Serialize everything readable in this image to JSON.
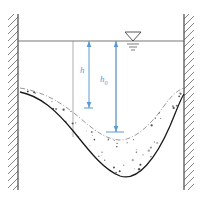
{
  "figure": {
    "width": 202,
    "height": 202,
    "background": "#ffffff"
  },
  "colors": {
    "wall_line": "#555555",
    "hatch": "#666666",
    "water_surface": "#666666",
    "dimension": "#5b9bd5",
    "original_bed": "#777777",
    "scoured_bed": "#1a1a1a",
    "sediment_stipple": "#3a3a3a",
    "water_symbol": "#444444"
  },
  "walls": {
    "left": {
      "name": "left-bank-wall",
      "x": 18,
      "y_top": 14,
      "y_bottom": 190,
      "hatch_side": "left"
    },
    "right": {
      "name": "right-bank-wall",
      "x": 184,
      "y_top": 14,
      "y_bottom": 190,
      "hatch_side": "right"
    }
  },
  "water_surface": {
    "label": "water-surface-line",
    "y": 41,
    "x_start": 18,
    "x_end": 184
  },
  "water_level_symbol": {
    "label": "water-level-triangle",
    "x": 133,
    "y": 41,
    "triangle_half_width": 8,
    "triangle_height": 9,
    "tick_widths": [
      11,
      7,
      4
    ]
  },
  "dimensions": [
    {
      "id": "h",
      "label": "h",
      "subscript": "",
      "x": 89,
      "y_top": 41,
      "y_bottom": 108,
      "value_text": "h",
      "label_x": 83,
      "label_y": 71,
      "arrow": "double-headed",
      "baseline_tick_width": 9
    },
    {
      "id": "h0",
      "label": "h",
      "subscript": "0",
      "x": 116,
      "y_top": 41,
      "y_bottom": 132,
      "value_text": "h0",
      "label_x": 103,
      "label_y": 80,
      "arrow": "double-headed",
      "baseline_tick_width": 18
    }
  ],
  "guide_lines": [
    {
      "name": "left-datum-guide",
      "x": 73,
      "y_top": 41,
      "y_bottom": 137
    },
    {
      "name": "right-datum-guide",
      "x": 116,
      "y_top": 41,
      "y_bottom": 132
    }
  ],
  "beds": {
    "original_bed": {
      "name": "original-bed-profile",
      "style": "dashed-light",
      "path": "M 20 88 C 45 92, 62 103, 80 118 C 96 132, 108 140, 120 140 C 134 140, 150 126, 164 106 C 172 95, 178 90, 184 88"
    },
    "scoured_bed": {
      "name": "scoured-bed-profile",
      "style": "solid-dark",
      "path": "M 20 92 C 40 96, 56 110, 74 132 C 90 152, 104 170, 120 176 C 138 182, 156 158, 170 126 C 176 112, 180 100, 184 94"
    }
  },
  "sediment": {
    "name": "sediment-stipple-region",
    "description": "Stippled granular fill between original bed and scoured bed",
    "dot_count": 240
  }
}
